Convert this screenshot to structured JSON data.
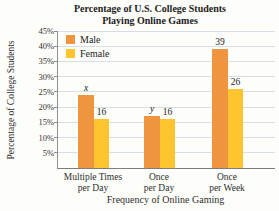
{
  "chart_data": {
    "type": "bar",
    "title": "Percentage of U.S. College Students Playing Online Games",
    "title_lines": [
      "Percentage of U.S. College Students",
      "Playing Online Games"
    ],
    "xlabel": "Frequency of Online Gaming",
    "ylabel": "Percentage of College Students",
    "categories": [
      {
        "line1": "Multiple Times",
        "line2": "per Day"
      },
      {
        "line1": "Once",
        "line2": "per Day"
      },
      {
        "line1": "Once",
        "line2": "per Week"
      }
    ],
    "series": [
      {
        "name": "Male",
        "color": "#F0953F",
        "values": [
          24,
          17,
          39
        ],
        "bar_labels": [
          "x",
          "y",
          "39"
        ]
      },
      {
        "name": "Female",
        "color": "#FFC52E",
        "values": [
          16,
          16,
          26
        ],
        "bar_labels": [
          "16",
          "16",
          "26"
        ]
      }
    ],
    "ylim": [
      0,
      45
    ],
    "yticks": [
      5,
      10,
      15,
      20,
      25,
      30,
      35,
      40,
      45
    ],
    "ytick_suffix": "%",
    "grid": true,
    "legend_position": "top-left",
    "colors": {
      "male": "#F0953F",
      "female": "#FFC52E",
      "gridline": "#d6dfe5",
      "axis": "#8f8f8f",
      "text": "#2e2e2e",
      "background": "#fdfdfa"
    }
  }
}
